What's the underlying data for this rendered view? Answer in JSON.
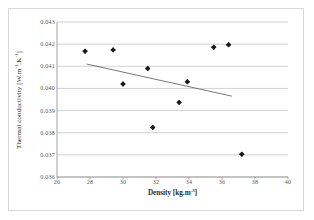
{
  "chart_data": {
    "type": "scatter",
    "title": "",
    "xlabel": "Density [kg.m-3]",
    "ylabel": "Thermal conductivity [W.m-1.K-1]",
    "xlim": [
      26,
      40
    ],
    "ylim": [
      0.036,
      0.043
    ],
    "grid": "horizontal",
    "legend": "none",
    "xticks": [
      "26",
      "28",
      "30",
      "32",
      "34",
      "36",
      "38",
      "40"
    ],
    "xtick_values": [
      26,
      28,
      30,
      32,
      34,
      36,
      38,
      40
    ],
    "yticks": [
      "0.036",
      "0.037",
      "0.038",
      "0.039",
      "0.040",
      "0.041",
      "0.042",
      "0.043"
    ],
    "ytick_values": [
      0.036,
      0.037,
      0.038,
      0.039,
      0.04,
      0.041,
      0.042,
      0.043
    ],
    "series": [
      {
        "name": "measurements",
        "marker": "diamond",
        "color": "#1a1a1a",
        "x": [
          27.7,
          29.4,
          30.0,
          31.5,
          31.8,
          33.4,
          33.9,
          35.5,
          36.4,
          37.2
        ],
        "y": [
          0.04168,
          0.04174,
          0.0402,
          0.0409,
          0.03824,
          0.03937,
          0.0403,
          0.04186,
          0.04197,
          0.03703
        ]
      },
      {
        "name": "linear-trendline",
        "marker": "none",
        "color": "#555555",
        "x": [
          27.8,
          36.6
        ],
        "y": [
          0.0411,
          0.03965
        ]
      }
    ]
  },
  "axes": {
    "x_title_main": "Density [kg.m",
    "x_title_sup": "-3",
    "x_title_tail": "]",
    "y_title_main": "Thermal conductivity [W.m",
    "y_title_sup1": "-1",
    "y_title_mid": ".K",
    "y_title_sup2": "-1",
    "y_title_tail": "]"
  }
}
